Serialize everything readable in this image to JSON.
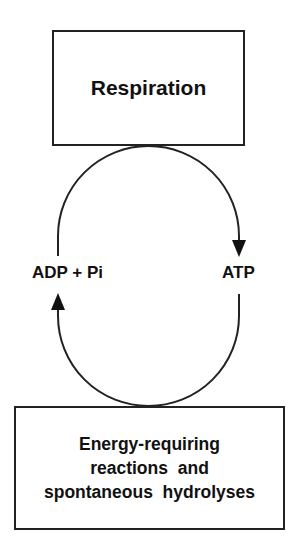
{
  "diagram": {
    "top_box": {
      "label": "Respiration"
    },
    "bottom_box": {
      "lines": [
        "Energy-requiring",
        "reactions  and",
        "spontaneous  hydrolyses"
      ]
    },
    "left_label": "ADP + Pi",
    "right_label": "ATP",
    "arrows": [
      {
        "from": "ADP + Pi",
        "to": "ATP",
        "via": "Respiration",
        "direction": "clockwise-top"
      },
      {
        "from": "ATP",
        "to": "ADP + Pi",
        "via": "Energy-requiring reactions and spontaneous hydrolyses",
        "direction": "clockwise-bottom"
      }
    ],
    "colors": {
      "stroke": "#222222",
      "text": "#111111",
      "background": "#ffffff"
    }
  }
}
